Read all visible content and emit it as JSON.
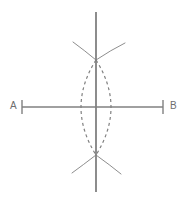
{
  "figure": {
    "type": "geometric-construction",
    "background_color": "#ffffff",
    "stroke_color": "#808080",
    "label_color": "#6e6e6e",
    "canvas": {
      "width": 187,
      "height": 204
    }
  },
  "labels": {
    "point_a": "A",
    "point_b": "B"
  },
  "geometry": {
    "segment_ab": {
      "name": "segment-ab",
      "x1": 22,
      "y1": 107,
      "x2": 163,
      "y2": 107,
      "stroke_width": 1.6,
      "dashed": false
    },
    "endpoint_tick_a": {
      "name": "tick-a",
      "x": 22,
      "y1": 100,
      "y2": 114,
      "stroke_width": 1.4
    },
    "endpoint_tick_b": {
      "name": "tick-b",
      "x": 163,
      "y1": 100,
      "y2": 114,
      "stroke_width": 1.4
    },
    "perpendicular_bisector": {
      "name": "perpendicular-bisector",
      "x1": 96,
      "y1": 12,
      "x2": 96,
      "y2": 192,
      "stroke_width": 1.8,
      "dashed": false
    },
    "midpoint": {
      "x": 96,
      "y": 107
    },
    "arc_intersection_top": {
      "x": 96,
      "y": 60
    },
    "arc_intersection_bottom": {
      "x": 96,
      "y": 155
    },
    "dashed_arc_left": {
      "name": "dashed-arc-left",
      "description": "Arc centered near A passing through top and bottom intersections, bulging left to x=82",
      "start": {
        "x": 96,
        "y": 60
      },
      "end": {
        "x": 96,
        "y": 155
      },
      "control": {
        "x": 66,
        "y": 107
      },
      "dash_pattern": "3,3",
      "stroke_width": 1.2
    },
    "dashed_arc_right": {
      "name": "dashed-arc-right",
      "description": "Arc centered near B passing through top and bottom intersections, bulging right to x=110",
      "start": {
        "x": 96,
        "y": 60
      },
      "end": {
        "x": 96,
        "y": 155
      },
      "control": {
        "x": 126,
        "y": 107
      },
      "dash_pattern": "3,3",
      "stroke_width": 1.2
    },
    "compass_wings": [
      {
        "name": "wing-top-left",
        "x1": 73,
        "y1": 42,
        "cx": 84,
        "cy": 50,
        "x2": 96,
        "y2": 60
      },
      {
        "name": "wing-top-right",
        "x1": 125,
        "y1": 43,
        "cx": 111,
        "cy": 50,
        "x2": 96,
        "y2": 60
      },
      {
        "name": "wing-bottom-left",
        "x1": 72,
        "y1": 173,
        "cx": 83,
        "cy": 165,
        "x2": 96,
        "y2": 155
      },
      {
        "name": "wing-bottom-right",
        "x1": 121,
        "y1": 174,
        "cx": 110,
        "cy": 165,
        "x2": 96,
        "y2": 155
      }
    ]
  }
}
